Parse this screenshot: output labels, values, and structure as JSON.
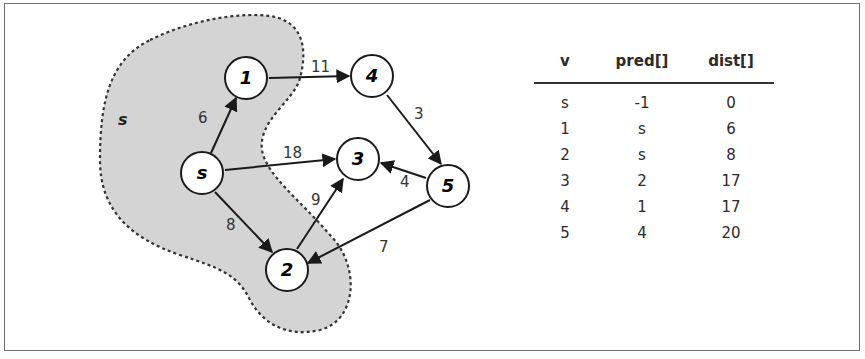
{
  "diagram": {
    "region_label": "s",
    "nodes": [
      {
        "id": "s",
        "label": "s",
        "x": 202,
        "y": 173
      },
      {
        "id": "1",
        "label": "1",
        "x": 246,
        "y": 78
      },
      {
        "id": "4",
        "label": "4",
        "x": 372,
        "y": 76
      },
      {
        "id": "3",
        "label": "3",
        "x": 358,
        "y": 159
      },
      {
        "id": "5",
        "label": "5",
        "x": 448,
        "y": 186
      },
      {
        "id": "2",
        "label": "2",
        "x": 287,
        "y": 270
      }
    ],
    "edges": [
      {
        "from": "s",
        "to": "1",
        "weight": "6"
      },
      {
        "from": "1",
        "to": "4",
        "weight": "11"
      },
      {
        "from": "4",
        "to": "5",
        "weight": "3"
      },
      {
        "from": "s",
        "to": "3",
        "weight": "18"
      },
      {
        "from": "5",
        "to": "3",
        "weight": "4"
      },
      {
        "from": "s",
        "to": "2",
        "weight": "8"
      },
      {
        "from": "2",
        "to": "3",
        "weight": "9"
      },
      {
        "from": "5",
        "to": "2",
        "weight": "7"
      }
    ]
  },
  "table": {
    "headers": [
      "v",
      "pred[]",
      "dist[]"
    ],
    "rows": [
      [
        "s",
        "-1",
        "0"
      ],
      [
        "1",
        "s",
        "6"
      ],
      [
        "2",
        "s",
        "8"
      ],
      [
        "3",
        "2",
        "17"
      ],
      [
        "4",
        "1",
        "17"
      ],
      [
        "5",
        "4",
        "20"
      ]
    ]
  }
}
